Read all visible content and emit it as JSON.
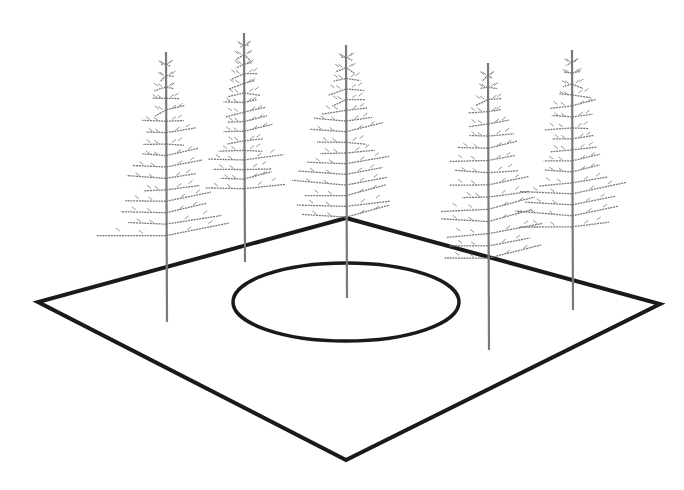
{
  "scene": {
    "description": "Perspective view of square plot with central ellipse and five conifer trees",
    "background": "#ffffff",
    "plot": {
      "stroke": "#1a1a1a",
      "corners": {
        "top": [
          346,
          218
        ],
        "right": [
          660,
          304
        ],
        "bottom": [
          346,
          460
        ],
        "left": [
          38,
          302
        ]
      }
    },
    "ellipse": {
      "cx": 346,
      "cy": 302,
      "rx": 113,
      "ry": 39,
      "stroke": "#1a1a1a"
    },
    "tree_color": "#7a7a7a",
    "trees": [
      {
        "id": "tree-1",
        "x": 166,
        "top": 52,
        "base": 322,
        "width": 52
      },
      {
        "id": "tree-2",
        "x": 244,
        "top": 33,
        "base": 262,
        "width": 42
      },
      {
        "id": "tree-3",
        "x": 346,
        "top": 45,
        "base": 298,
        "width": 62
      },
      {
        "id": "tree-4",
        "x": 488,
        "top": 63,
        "base": 350,
        "width": 62
      },
      {
        "id": "tree-5",
        "x": 572,
        "top": 50,
        "base": 310,
        "width": 56
      }
    ]
  }
}
